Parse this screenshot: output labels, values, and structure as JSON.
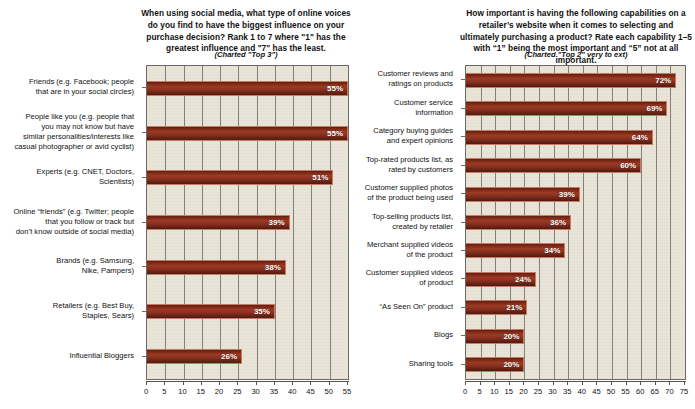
{
  "chart_data": [
    {
      "type": "bar",
      "orientation": "horizontal",
      "title": "When using social media, what type of online voices do you find to have the biggest influence on your purchase decision? Rank 1 to 7 where \"1\" has the greatest influence and \"7\" has the least.",
      "subtitle": "(Charted \"Top 3\")",
      "xlabel": "",
      "ylabel": "",
      "xlim": [
        0,
        55
      ],
      "xticks": [
        0,
        5,
        10,
        15,
        20,
        25,
        30,
        35,
        40,
        45,
        50,
        55
      ],
      "grid": true,
      "legend": "none",
      "bar_color": "#8d3320",
      "plot_background": "#e9e4d8",
      "categories": [
        "Friends (e.g. Facebook; people\nthat are in your social circles)",
        "People like you (e.g. people that\nyou may not know but have\nsimilar personalities/interests like\ncasual photographer or avid cyclist)",
        "Experts (e.g. CNET, Doctors,\nScientists)",
        "Online “friends” (e.g. Twitter; people\nthat you follow or track but\ndon’t know outside of social media)",
        "Brands (e.g. Samsung,\nNike, Pampers)",
        "Retailers (e.g. Best Buy,\nStaples, Sears)",
        "Influential Bloggers"
      ],
      "values": [
        55,
        55,
        51,
        39,
        38,
        35,
        26
      ],
      "data_labels": [
        "55%",
        "55%",
        "51%",
        "39%",
        "38%",
        "35%",
        "26%"
      ]
    },
    {
      "type": "bar",
      "orientation": "horizontal",
      "title": "How important is having the following capabilities on a retailer’s website when it comes to selecting and ultimately purchasing a product? Rate each capability 1–5 with “1” being the most important and “5” not at all important.",
      "subtitle": "(Charted \"Top 2\" very to ext)",
      "xlabel": "",
      "ylabel": "",
      "xlim": [
        0,
        75
      ],
      "xticks": [
        0,
        5,
        10,
        15,
        20,
        25,
        30,
        35,
        40,
        45,
        50,
        55,
        60,
        65,
        70,
        75
      ],
      "grid": true,
      "legend": "none",
      "bar_color": "#8d3320",
      "plot_background": "#e9e4d8",
      "categories": [
        "Customer reviews and\nratings on products",
        "Customer service information",
        "Category buying guides\nand expert opinions",
        "Top-rated products list, as\nrated by customers",
        "Customer supplied photos\nof the product being used",
        "Top-selling products list,\ncreated by retailer",
        "Merchant supplied videos\nof the product",
        "Customer supplied videos\nof product",
        "“As Seen On” product",
        "Blogs",
        "Sharing tools"
      ],
      "values": [
        72,
        69,
        64,
        60,
        39,
        36,
        34,
        24,
        21,
        20,
        20
      ],
      "data_labels": [
        "72%",
        "69%",
        "64%",
        "60%",
        "39%",
        "36%",
        "34%",
        "24%",
        "21%",
        "20%",
        "20%"
      ]
    }
  ]
}
